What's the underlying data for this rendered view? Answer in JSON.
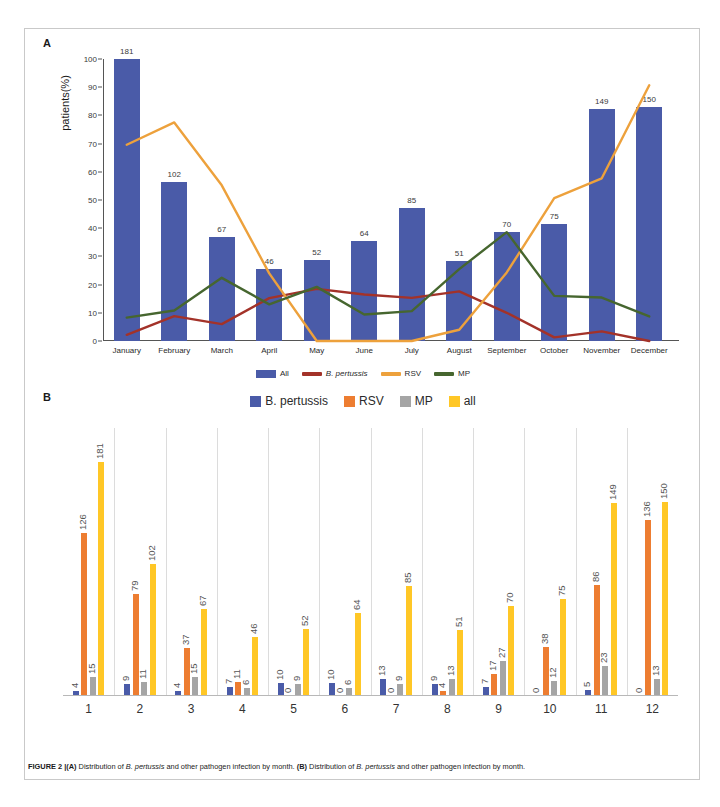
{
  "figure": {
    "panel_a_letter": "A",
    "panel_b_letter": "B",
    "caption_prefix": "FIGURE 2 |",
    "caption_a_tag": "(A)",
    "caption_a_text_1": " Distribution of ",
    "caption_a_species": "B. pertussis",
    "caption_a_text_2": " and other pathogen infection by month. ",
    "caption_b_tag": "(B)",
    "caption_b_text_1": " Distribution of ",
    "caption_b_species": "B. pertussis",
    "caption_b_text_2": " and other pathogen infection by month."
  },
  "colors": {
    "all_bar_blue": "#4a5ba8",
    "b_pertussis_line_red": "#a33229",
    "rsv_line_orange": "#eda13c",
    "mp_line_green": "#46662f",
    "b_pertussis_bar_blue": "#4a5ba8",
    "rsv_bar_orange": "#ed7d31",
    "mp_bar_gray": "#a5a5a5",
    "all_bar_yellow": "#ffc726"
  },
  "chart_data": [
    {
      "panel": "A",
      "type": "bar",
      "title": "",
      "xlabel": "",
      "ylabel": "patients(%)",
      "ylim": [
        0,
        100
      ],
      "yticks": [
        0,
        10,
        20,
        30,
        40,
        50,
        60,
        70,
        80,
        90,
        100
      ],
      "grid": false,
      "legend_position": "bottom",
      "categories": [
        "January",
        "February",
        "March",
        "April",
        "May",
        "June",
        "July",
        "August",
        "September",
        "October",
        "November",
        "December"
      ],
      "series": [
        {
          "name": "All",
          "type": "bar",
          "color": "#4a5ba8",
          "counts": [
            181,
            102,
            67,
            46,
            52,
            64,
            85,
            51,
            70,
            75,
            149,
            150
          ],
          "percent": [
            100,
            56.4,
            37.0,
            25.4,
            28.7,
            35.4,
            47.0,
            28.2,
            38.7,
            41.4,
            82.3,
            82.9
          ]
        },
        {
          "name": "B. pertussis",
          "type": "line",
          "color": "#a33229",
          "percent": [
            2.2,
            8.8,
            6.0,
            15.2,
            18.5,
            16.5,
            15.3,
            17.6,
            10.0,
            1.3,
            3.4,
            0.0
          ]
        },
        {
          "name": "RSV",
          "type": "line",
          "color": "#eda13c",
          "percent": [
            69.6,
            77.5,
            55.2,
            24.0,
            0.0,
            0.0,
            0.0,
            4.0,
            24.3,
            50.7,
            57.7,
            90.7
          ]
        },
        {
          "name": "MP",
          "type": "line",
          "color": "#46662f",
          "percent": [
            8.3,
            10.8,
            22.4,
            13.0,
            19.2,
            9.4,
            10.6,
            25.5,
            38.6,
            16.0,
            15.4,
            8.7
          ]
        }
      ]
    },
    {
      "panel": "B",
      "type": "bar",
      "title": "",
      "xlabel": "",
      "ylabel": "",
      "ylim": [
        0,
        181
      ],
      "grid": false,
      "legend_position": "top",
      "categories": [
        "1",
        "2",
        "3",
        "4",
        "5",
        "6",
        "7",
        "8",
        "9",
        "10",
        "11",
        "12"
      ],
      "series": [
        {
          "name": "B. pertussis",
          "color": "#4a5ba8",
          "values": [
            4,
            9,
            4,
            7,
            10,
            10,
            13,
            9,
            7,
            0,
            5,
            0
          ]
        },
        {
          "name": "RSV",
          "color": "#ed7d31",
          "values": [
            126,
            79,
            37,
            11,
            0,
            0,
            0,
            4,
            17,
            38,
            86,
            136
          ]
        },
        {
          "name": "MP",
          "color": "#a5a5a5",
          "values": [
            15,
            11,
            15,
            6,
            9,
            6,
            9,
            13,
            27,
            12,
            23,
            13
          ]
        },
        {
          "name": "all",
          "color": "#ffc726",
          "values": [
            181,
            102,
            67,
            46,
            52,
            64,
            85,
            51,
            70,
            75,
            149,
            150
          ]
        }
      ]
    }
  ],
  "panel_a_legend": [
    {
      "label": "All",
      "color": "#4a5ba8",
      "marker": "swatch",
      "italic": false
    },
    {
      "label": "B. pertussis",
      "color": "#a33229",
      "marker": "line",
      "italic": true
    },
    {
      "label": "RSV",
      "color": "#eda13c",
      "marker": "line",
      "italic": false
    },
    {
      "label": "MP",
      "color": "#46662f",
      "marker": "line",
      "italic": false
    }
  ],
  "panel_b_legend": [
    {
      "label": "B. pertussis",
      "color": "#4a5ba8"
    },
    {
      "label": "RSV",
      "color": "#ed7d31"
    },
    {
      "label": "MP",
      "color": "#a5a5a5"
    },
    {
      "label": "all",
      "color": "#ffc726"
    }
  ]
}
